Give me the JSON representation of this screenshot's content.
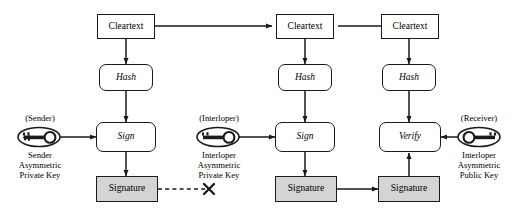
{
  "diagram": {
    "colors": {
      "stroke": "#1a1a1a",
      "signature_fill": "#d4d4d4",
      "node_fill": "#ffffff",
      "background": "#ffffff"
    },
    "columns": [
      {
        "id": "sender",
        "role": "Sender",
        "nodes": {
          "cleartext": "Cleartext",
          "hash": "Hash",
          "operation": "Sign",
          "signature": "Signature"
        },
        "key": {
          "top_label": "(Sender)",
          "icon": "key-icon",
          "direction": "right",
          "bottom_label_lines": [
            "Sender",
            "Asymmetric",
            "Private Key"
          ]
        }
      },
      {
        "id": "interloper",
        "role": "Interloper",
        "nodes": {
          "cleartext": "Cleartext",
          "hash": "Hash",
          "operation": "Sign",
          "signature": "Signature"
        },
        "key": {
          "top_label": "(Interloper)",
          "icon": "key-icon",
          "direction": "right",
          "bottom_label_lines": [
            "Interloper",
            "Asymmetric",
            "Private Key"
          ]
        }
      },
      {
        "id": "receiver",
        "role": "Receiver",
        "nodes": {
          "cleartext": "Cleartext",
          "hash": "Hash",
          "operation": "Verify",
          "signature": "Signature"
        },
        "key": {
          "top_label": "(Receiver)",
          "icon": "key-icon",
          "direction": "left",
          "bottom_label_lines": [
            "Interloper",
            "Asymmetric",
            "Public Key"
          ]
        }
      }
    ],
    "connectors": [
      {
        "id": "cleartext-1-to-2",
        "style": "solid",
        "arrow": true
      },
      {
        "id": "cleartext-2-to-3",
        "style": "solid",
        "arrow": true
      },
      {
        "id": "cleartext-1-to-hash-1",
        "style": "solid",
        "arrow": true
      },
      {
        "id": "cleartext-2-to-hash-2",
        "style": "solid",
        "arrow": true
      },
      {
        "id": "cleartext-3-to-hash-3",
        "style": "solid",
        "arrow": true
      },
      {
        "id": "hash-1-to-sign-1",
        "style": "solid",
        "arrow": true
      },
      {
        "id": "hash-2-to-sign-2",
        "style": "solid",
        "arrow": true
      },
      {
        "id": "hash-3-to-verify",
        "style": "solid",
        "arrow": true
      },
      {
        "id": "key-1-to-sign-1",
        "style": "solid",
        "arrow": true
      },
      {
        "id": "key-2-to-sign-2",
        "style": "solid",
        "arrow": true
      },
      {
        "id": "key-3-to-verify",
        "style": "solid",
        "arrow": true
      },
      {
        "id": "sign-1-to-signature-1",
        "style": "solid",
        "arrow": true
      },
      {
        "id": "sign-2-to-signature-2",
        "style": "solid",
        "arrow": true
      },
      {
        "id": "signature-1-to-blocked",
        "style": "dashed",
        "arrow": false,
        "terminator": "x-mark"
      },
      {
        "id": "signature-2-to-signature-3",
        "style": "solid",
        "arrow": true
      },
      {
        "id": "signature-3-to-verify",
        "style": "solid",
        "arrow": true
      }
    ],
    "blocked_marker": {
      "name": "x-mark",
      "meaning": "blocked / discarded signature path"
    }
  }
}
